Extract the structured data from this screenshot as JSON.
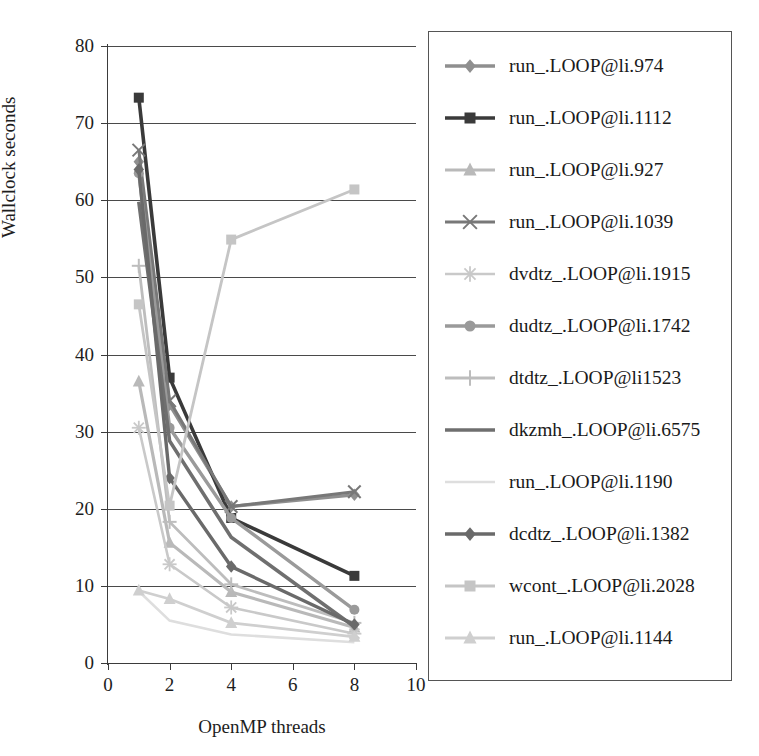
{
  "chart_data": {
    "type": "line",
    "title": "",
    "xlabel": "OpenMP threads",
    "ylabel": "Wallclock seconds",
    "xlim": [
      0,
      10
    ],
    "ylim": [
      0,
      80
    ],
    "xticks": [
      0,
      2,
      4,
      6,
      8,
      10
    ],
    "yticks": [
      0,
      10,
      20,
      30,
      40,
      50,
      60,
      70,
      80
    ],
    "grid": "horizontal",
    "legend_position": "right-outside",
    "x": [
      1,
      2,
      4,
      8
    ],
    "series": [
      {
        "name": "run_.LOOP@li.974",
        "values": [
          65.0,
          33.5,
          20.3,
          21.8
        ],
        "color": "#8f8f8f",
        "marker": "diamond",
        "width": 3.4
      },
      {
        "name": "run_.LOOP@li.1112",
        "values": [
          73.3,
          37.0,
          18.8,
          11.3
        ],
        "color": "#3a3a3a",
        "marker": "square",
        "width": 3.6
      },
      {
        "name": "run_.LOOP@li.927",
        "values": [
          36.5,
          15.6,
          9.2,
          4.6
        ],
        "color": "#b9b9b9",
        "marker": "triangle",
        "width": 3.2
      },
      {
        "name": "run_.LOOP@li.1039",
        "values": [
          66.5,
          34.0,
          20.3,
          22.2
        ],
        "color": "#787878",
        "marker": "x",
        "width": 3.0
      },
      {
        "name": "dvdtz_.LOOP@li.1915",
        "values": [
          30.5,
          12.8,
          7.2,
          3.8
        ],
        "color": "#c9c9c9",
        "marker": "asterisk",
        "width": 2.6
      },
      {
        "name": "dudtz_.LOOP@li.1742",
        "values": [
          63.5,
          30.5,
          18.8,
          6.9
        ],
        "color": "#9a9a9a",
        "marker": "circle",
        "width": 3.4
      },
      {
        "name": "dtdtz_.LOOP@li1523",
        "values": [
          51.5,
          18.3,
          10.2,
          5.2
        ],
        "color": "#bdbdbd",
        "marker": "plus",
        "width": 2.8
      },
      {
        "name": "dkzmh_.LOOP@li.6575",
        "values": [
          59.8,
          28.8,
          16.3,
          4.7
        ],
        "color": "#6f6f6f",
        "marker": "none",
        "width": 3.6
      },
      {
        "name": "run_.LOOP@li.1190",
        "values": [
          9.3,
          5.5,
          3.7,
          2.7
        ],
        "color": "#dedede",
        "marker": "none",
        "width": 2.6
      },
      {
        "name": "dcdtz_.LOOP@li.1382",
        "values": [
          64.0,
          24.0,
          12.5,
          5.0
        ],
        "color": "#6a6a6a",
        "marker": "diamond",
        "width": 3.4
      },
      {
        "name": "wcont_.LOOP@li.2028",
        "values": [
          46.5,
          20.4,
          54.9,
          61.4
        ],
        "color": "#c5c5c5",
        "marker": "square",
        "width": 2.8
      },
      {
        "name": "run_.LOOP@li.1144",
        "values": [
          9.4,
          8.3,
          5.2,
          3.4
        ],
        "color": "#cfcfcf",
        "marker": "triangle",
        "width": 2.8
      }
    ]
  },
  "axes": {
    "ylabel": "Wallclock seconds",
    "xlabel": "OpenMP threads",
    "ytick_labels": [
      "0",
      "10",
      "20",
      "30",
      "40",
      "50",
      "60",
      "70",
      "80"
    ],
    "xtick_labels": [
      "0",
      "2",
      "4",
      "6",
      "8",
      "10"
    ]
  },
  "legend": {
    "items": [
      {
        "label": "run_.LOOP@li.974"
      },
      {
        "label": "run_.LOOP@li.1112"
      },
      {
        "label": "run_.LOOP@li.927"
      },
      {
        "label": "run_.LOOP@li.1039"
      },
      {
        "label": "dvdtz_.LOOP@li.1915"
      },
      {
        "label": "dudtz_.LOOP@li.1742"
      },
      {
        "label": "dtdtz_.LOOP@li1523"
      },
      {
        "label": "dkzmh_.LOOP@li.6575"
      },
      {
        "label": "run_.LOOP@li.1190"
      },
      {
        "label": "dcdtz_.LOOP@li.1382"
      },
      {
        "label": "wcont_.LOOP@li.2028"
      },
      {
        "label": "run_.LOOP@li.1144"
      }
    ]
  },
  "colors": {
    "axis": "#3b3b3b",
    "grid": "#4a4a4a",
    "legend_border": "#555555",
    "background": "#ffffff"
  }
}
